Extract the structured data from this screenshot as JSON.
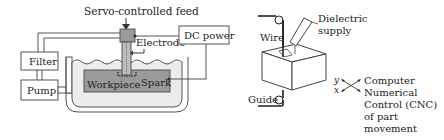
{
  "edm_diagram": {
    "title": "Servo-controlled feed",
    "labels": {
      "servo": "Servo-controlled feed",
      "electrode": "Electrode",
      "dc_power": "DC power",
      "filter": "Filter",
      "pump": "Pump",
      "workpiece": "Workpiece",
      "spark": "Spark",
      "dielectric": "Dielectric"
    }
  },
  "wire_edm_diagram": {
    "labels": {
      "wire": "Wire",
      "dielectric_supply_1": "Dielectric",
      "dielectric_supply_2": "supply",
      "guide": "Guide",
      "axis_y": "y",
      "axis_x": "x",
      "cnc_1": "Computer",
      "cnc_2": "Numerical",
      "cnc_3": "Control (CNC)",
      "cnc_4": "of part",
      "cnc_5": "movement"
    }
  },
  "colors": {
    "line": "#555555",
    "workpiece_fill": "#9a9a9a",
    "dielectric_fill": "#e6e6e6",
    "text": "#222222"
  }
}
